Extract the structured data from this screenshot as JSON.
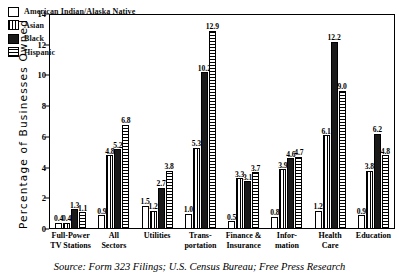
{
  "chart_data": {
    "type": "bar",
    "title": "",
    "xlabel": "",
    "ylabel": "Percentage of Businesses Owned",
    "ylim": [
      0,
      14
    ],
    "yticks": [
      "0",
      "2",
      "4",
      "6",
      "8",
      "10",
      "12",
      "14"
    ],
    "grid": false,
    "legend_position": "top-left",
    "categories": [
      "Full-Power TV Stations",
      "All Sectors",
      "Utilities",
      "Transportation",
      "Finance & Insurance",
      "Information",
      "Health Care",
      "Education"
    ],
    "category_lines": [
      [
        "Full-Power",
        "TV Stations"
      ],
      [
        "All",
        "Sectors"
      ],
      [
        "Utilities",
        ""
      ],
      [
        "Trans-",
        "portation"
      ],
      [
        "Finance &",
        "Insurance"
      ],
      [
        "Infor-",
        "mation"
      ],
      [
        "Health",
        "Care"
      ],
      [
        "Education",
        ""
      ]
    ],
    "series": [
      {
        "name": "American Indian/Alaska Native",
        "pattern": "empty",
        "values": [
          0.4,
          0.9,
          1.5,
          1.0,
          0.5,
          0.8,
          1.2,
          0.9
        ]
      },
      {
        "name": "Asian",
        "pattern": "vertical-stripes",
        "values": [
          0.4,
          4.8,
          1.2,
          5.3,
          3.3,
          3.9,
          6.1,
          3.8
        ]
      },
      {
        "name": "Black",
        "pattern": "solid-black",
        "values": [
          1.3,
          5.2,
          2.7,
          10.2,
          3.1,
          4.6,
          12.2,
          6.2
        ]
      },
      {
        "name": "Hispanic",
        "pattern": "horizontal-stripes",
        "values": [
          1.1,
          6.8,
          3.8,
          12.9,
          3.7,
          4.7,
          9.0,
          4.8
        ]
      }
    ],
    "source": "Source: Form 323 Filings; U.S. Census Bureau; Free Press Research"
  }
}
